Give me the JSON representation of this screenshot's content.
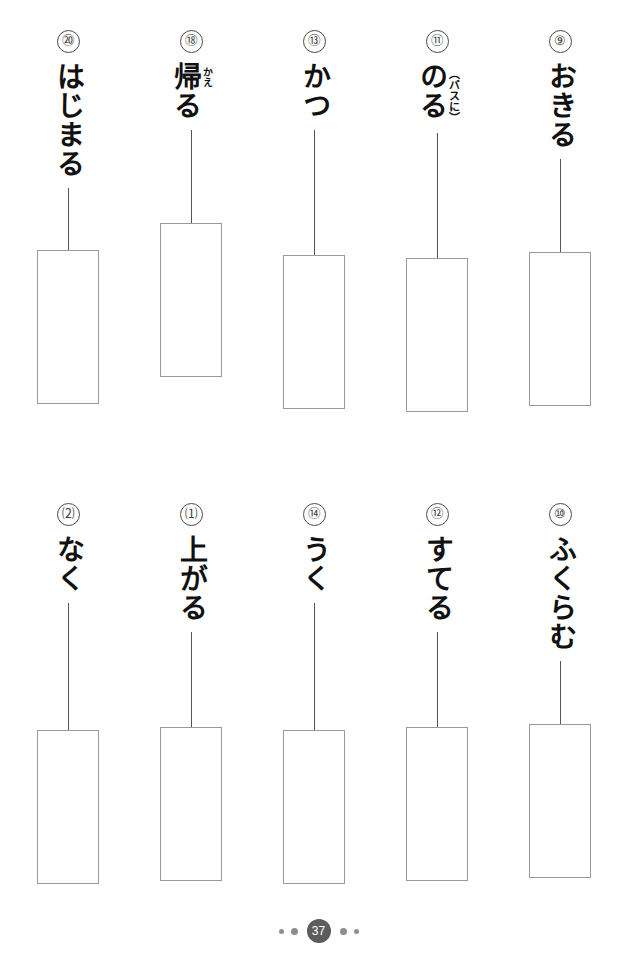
{
  "page": {
    "page_number": "37",
    "footer_dots_left": [
      "small",
      "medium"
    ],
    "footer_dots_right": [
      "medium",
      "small"
    ],
    "ink_color": "#111111",
    "box_border_color": "#9a9a9a",
    "badge_color": "#5c5c5c"
  },
  "rows": [
    {
      "name": "top-row",
      "items": [
        {
          "number": "⑳",
          "word": "はじまる",
          "annotation": "",
          "annotation_type": "none"
        },
        {
          "number": "⑱",
          "word": "帰る",
          "annotation": "かえ",
          "annotation_type": "furigana"
        },
        {
          "number": "⑬",
          "word": "かつ",
          "annotation": "",
          "annotation_type": "none"
        },
        {
          "number": "⑪",
          "word": "のる",
          "annotation": "（バスに）",
          "annotation_type": "note"
        },
        {
          "number": "⑨",
          "word": "おきる",
          "annotation": "",
          "annotation_type": "none"
        }
      ]
    },
    {
      "name": "bottom-row",
      "items": [
        {
          "number": "⑵",
          "word": "なく",
          "annotation": "",
          "annotation_type": "none"
        },
        {
          "number": "⑴",
          "word": "上がる",
          "annotation": "",
          "annotation_type": "none"
        },
        {
          "number": "⑭",
          "word": "うく",
          "annotation": "",
          "annotation_type": "none"
        },
        {
          "number": "⑫",
          "word": "すてる",
          "annotation": "",
          "annotation_type": "none"
        },
        {
          "number": "⑩",
          "word": "ふくらむ",
          "annotation": "",
          "annotation_type": "none"
        }
      ]
    }
  ],
  "layout": {
    "column_x": [
      8,
      131,
      254,
      377,
      500
    ],
    "top_row_y": 30,
    "bottom_row_y": 503,
    "top_box_y": 280,
    "bottom_box_y": 752
  }
}
